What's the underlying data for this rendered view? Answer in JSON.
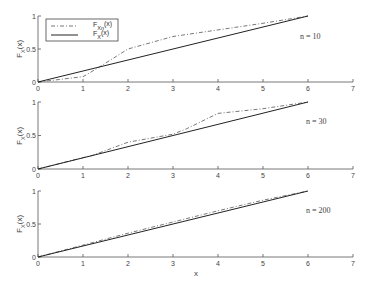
{
  "chart_data": [
    {
      "type": "line",
      "panel_label": "n = 10",
      "xlabel": "",
      "ylabel": "F_X(x)",
      "xlim": [
        0,
        7
      ],
      "ylim": [
        0,
        1
      ],
      "xticks": [
        "0",
        "1",
        "2",
        "3",
        "4",
        "5",
        "6",
        "7"
      ],
      "yticks": [
        "0",
        "0.5",
        "1"
      ],
      "legend": [
        "F_{Xn}(x)",
        "F_X(x)"
      ],
      "legend_position": "upper left",
      "grid": false,
      "series": [
        {
          "name": "F_{Xn}(x)",
          "style": "dash-dot",
          "x": [
            0,
            1,
            1.3,
            2,
            3,
            4,
            5,
            6
          ],
          "y": [
            0,
            0.08,
            0.2,
            0.5,
            0.69,
            0.79,
            0.89,
            1
          ]
        },
        {
          "name": "F_X(x)",
          "style": "solid",
          "x": [
            0,
            6
          ],
          "y": [
            0,
            1
          ]
        }
      ]
    },
    {
      "type": "line",
      "panel_label": "n = 30",
      "xlabel": "",
      "ylabel": "F_X(x)",
      "xlim": [
        0,
        7
      ],
      "ylim": [
        0,
        1
      ],
      "xticks": [
        "0",
        "1",
        "2",
        "3",
        "4",
        "5",
        "6",
        "7"
      ],
      "yticks": [
        "0",
        "0.5",
        "1"
      ],
      "grid": false,
      "series": [
        {
          "name": "F_{Xn}(x)",
          "style": "dash-dot",
          "x": [
            0,
            1,
            1.2,
            2,
            3,
            3.3,
            4,
            5,
            6
          ],
          "y": [
            0,
            0.17,
            0.2,
            0.4,
            0.52,
            0.6,
            0.83,
            0.9,
            1
          ]
        },
        {
          "name": "F_X(x)",
          "style": "solid",
          "x": [
            0,
            6
          ],
          "y": [
            0,
            1
          ]
        }
      ]
    },
    {
      "type": "line",
      "panel_label": "n = 200",
      "xlabel": "x",
      "ylabel": "F_X(x)",
      "xlim": [
        0,
        7
      ],
      "ylim": [
        0,
        1
      ],
      "xticks": [
        "0",
        "1",
        "2",
        "3",
        "4",
        "5",
        "6",
        "7"
      ],
      "yticks": [
        "0",
        "0.5",
        "1"
      ],
      "grid": false,
      "series": [
        {
          "name": "F_{Xn}(x)",
          "style": "dash-dot",
          "x": [
            0,
            1,
            2,
            3,
            4,
            5,
            6
          ],
          "y": [
            0,
            0.18,
            0.36,
            0.53,
            0.7,
            0.86,
            1
          ]
        },
        {
          "name": "F_X(x)",
          "style": "solid",
          "x": [
            0,
            6
          ],
          "y": [
            0,
            1
          ]
        }
      ]
    }
  ],
  "legend": {
    "items": [
      {
        "label_main": "F",
        "label_sub": "Xn",
        "label_tail": "(x)",
        "style": "dash-dot"
      },
      {
        "label_main": "F",
        "label_sub": "X",
        "label_tail": "(x)",
        "style": "solid"
      }
    ]
  },
  "labels": {
    "ylabel_main": "F",
    "ylabel_sub": "X",
    "ylabel_tail": "(x)",
    "xlabel": "x"
  }
}
